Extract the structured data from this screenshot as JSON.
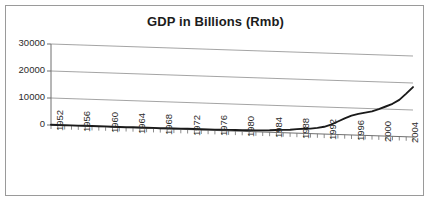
{
  "chart_data": {
    "type": "line",
    "title": "GDP in Billions (Rmb)",
    "xlabel": "",
    "ylabel": "",
    "ylim": [
      0,
      30000
    ],
    "yticks": [
      0,
      10000,
      20000,
      30000
    ],
    "grid": true,
    "legend": "none",
    "style": "3d-perspective",
    "x": [
      1952,
      1953,
      1954,
      1955,
      1956,
      1957,
      1958,
      1959,
      1960,
      1961,
      1962,
      1963,
      1964,
      1965,
      1966,
      1967,
      1968,
      1969,
      1970,
      1971,
      1972,
      1973,
      1974,
      1975,
      1976,
      1977,
      1978,
      1979,
      1980,
      1981,
      1982,
      1983,
      1984,
      1985,
      1986,
      1987,
      1988,
      1989,
      1990,
      1991,
      1992,
      1993,
      1994,
      1995,
      1996,
      1997,
      1998,
      1999,
      2000,
      2001,
      2002,
      2003,
      2004,
      2005
    ],
    "xtick_labels": [
      "1952",
      "1956",
      "1960",
      "1964",
      "1968",
      "1972",
      "1976",
      "1980",
      "1984",
      "1988",
      "1992",
      "1996",
      "2000",
      "2004"
    ],
    "series": [
      {
        "name": "GDP",
        "values": [
          68,
          82,
          86,
          91,
          103,
          107,
          131,
          144,
          146,
          122,
          115,
          123,
          145,
          172,
          187,
          177,
          172,
          194,
          225,
          243,
          252,
          272,
          279,
          299,
          294,
          321,
          365,
          406,
          455,
          489,
          532,
          596,
          721,
          902,
          1028,
          1205,
          1504,
          1700,
          1866,
          2178,
          2692,
          3533,
          4820,
          6079,
          7118,
          7897,
          8440,
          8968,
          9921,
          10966,
          12033,
          13582,
          15988,
          18494
        ]
      }
    ],
    "units": "Billions (Rmb)"
  },
  "axis": {
    "y_tick_labels": [
      "30000",
      "20000",
      "10000",
      "0"
    ]
  }
}
